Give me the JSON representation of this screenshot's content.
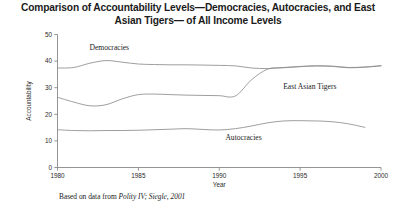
{
  "title": "Comparison of Accountability Levels—Democracies, Autocracies, and East Asian Tigers— of All Income Levels",
  "source": {
    "prefix": "Based on data from ",
    "citation": "Polity IV; Siegle, 2001"
  },
  "labels": {
    "democracies": "Democracies",
    "east_asian_tigers": "East Asian Tigers",
    "autocracies": "Autocracies"
  },
  "axes": {
    "x_title": "Year",
    "y_title": "Accountability",
    "x_ticks": [
      "1980",
      "1985",
      "1990",
      "1995",
      "2000"
    ],
    "y_ticks": [
      "0",
      "10",
      "20",
      "30",
      "40",
      "50"
    ]
  },
  "chart_data": {
    "type": "line",
    "title": "Comparison of Accountability Levels—Democracies, Autocracies, and East Asian Tigers— of All Income Levels",
    "xlabel": "Year",
    "ylabel": "Accountability",
    "xlim": [
      1980,
      2000
    ],
    "ylim": [
      0,
      50
    ],
    "xticks": [
      1980,
      1985,
      1990,
      1995,
      2000
    ],
    "yticks": [
      0,
      10,
      20,
      30,
      40,
      50
    ],
    "grid": false,
    "legend": "inline-annotations",
    "line_color": "#8d8d8d",
    "series": [
      {
        "name": "Democracies",
        "x": [
          1980,
          1981,
          1982,
          1983,
          1984,
          1985,
          1986,
          1987,
          1988,
          1989,
          1990,
          1991,
          1992,
          1993,
          1994,
          1995,
          1996,
          1997,
          1998,
          1999,
          2000
        ],
        "values": [
          37.4,
          37.6,
          39.2,
          40.2,
          39.6,
          38.9,
          38.7,
          38.6,
          38.6,
          38.5,
          38.4,
          38.2,
          37.4,
          37.2,
          37.6,
          38.0,
          38.2,
          38.1,
          37.6,
          37.8,
          38.3
        ]
      },
      {
        "name": "East Asian Tigers",
        "x": [
          1980,
          1981,
          1982,
          1983,
          1984,
          1985,
          1986,
          1987,
          1988,
          1989,
          1990,
          1991,
          1992,
          1993,
          1994,
          1995,
          1996,
          1997,
          1998,
          1999,
          2000
        ],
        "values": [
          26.4,
          24.6,
          23.2,
          23.6,
          25.8,
          27.4,
          27.6,
          27.4,
          27.2,
          27.1,
          27.0,
          26.9,
          33.0,
          37.0,
          37.5,
          37.9,
          38.2,
          38.0,
          37.5,
          37.7,
          38.2
        ]
      },
      {
        "name": "Autocracies",
        "x": [
          1980,
          1981,
          1982,
          1983,
          1984,
          1985,
          1986,
          1987,
          1988,
          1989,
          1990,
          1991,
          1992,
          1993,
          1994,
          1995,
          1996,
          1997,
          1998,
          1999
        ],
        "values": [
          14.2,
          13.9,
          13.8,
          13.9,
          13.9,
          14.0,
          14.2,
          14.4,
          14.6,
          14.3,
          14.1,
          14.6,
          15.6,
          16.8,
          17.5,
          17.6,
          17.5,
          17.2,
          16.4,
          15.1
        ]
      }
    ],
    "annotations": [
      {
        "text": "Democracies",
        "x": 1983.2,
        "y": 44.0
      },
      {
        "text": "East Asian Tigers",
        "x": 1995.6,
        "y": 29.5
      },
      {
        "text": "Autocracies",
        "x": 1991.5,
        "y": 10.2
      }
    ]
  }
}
